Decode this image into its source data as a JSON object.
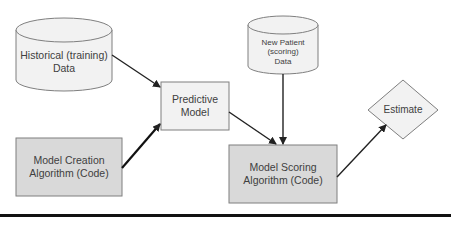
{
  "diagram": {
    "nodes": {
      "historical_data": {
        "shape": "cylinder",
        "line1": "Historical (training)",
        "line2": "Data"
      },
      "model_creation": {
        "shape": "rectangle",
        "line1": "Model Creation",
        "line2": "Algorithm (Code)"
      },
      "predictive_model": {
        "shape": "rectangle",
        "line1": "Predictive",
        "line2": "Model"
      },
      "new_patient_data": {
        "shape": "cylinder",
        "line1": "New Patient",
        "line2": "(scoring)",
        "line3": "Data"
      },
      "model_scoring": {
        "shape": "rectangle",
        "line1": "Model Scoring",
        "line2": "Algorithm (Code)"
      },
      "estimate": {
        "shape": "diamond",
        "line1": "Estimate"
      }
    },
    "edges": [
      {
        "from": "historical_data",
        "to": "predictive_model"
      },
      {
        "from": "model_creation",
        "to": "predictive_model"
      },
      {
        "from": "predictive_model",
        "to": "model_scoring"
      },
      {
        "from": "new_patient_data",
        "to": "model_scoring"
      },
      {
        "from": "model_scoring",
        "to": "estimate"
      }
    ],
    "colors": {
      "light_fill": "#f2f2f2",
      "dark_fill": "#d9d9d9",
      "stroke": "#7f7f7f",
      "arrow": "#222222",
      "text": "#404040"
    }
  }
}
